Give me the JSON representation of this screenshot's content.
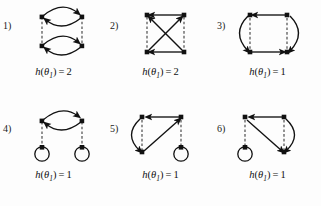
{
  "figure": {
    "name": "directed-graph-motif-figure",
    "background": "#fdfdfd",
    "ink_color": "#111111",
    "dashed_color": "#4d4d4d",
    "panels": [
      {
        "index_label": "1)",
        "caption": {
          "function": "h",
          "open": "(",
          "symbol": "θ",
          "subscript": "1",
          "close": ")",
          "equals": "=",
          "value": "2",
          "full": "h(θ₁) = 2"
        },
        "structure": "two stacked two-node bidirectional lens cycles joined by two vertical dashed links",
        "nodes": 4,
        "self_loops": 0,
        "dashed_links": 2,
        "directed_arcs": 4
      },
      {
        "index_label": "2)",
        "caption": {
          "function": "h",
          "open": "(",
          "symbol": "θ",
          "subscript": "1",
          "close": ")",
          "equals": "=",
          "value": "2",
          "full": "h(θ₁) = 2"
        },
        "structure": "square of four nodes with leftward top and bottom arrows, two crossing diagonal arrows, vertical dashed sides",
        "nodes": 4,
        "self_loops": 0,
        "dashed_links": 2,
        "directed_arcs": 4
      },
      {
        "index_label": "3)",
        "caption": {
          "function": "h",
          "open": "(",
          "symbol": "θ",
          "subscript": "1",
          "close": ")",
          "equals": "=",
          "value": "1",
          "full": "h(θ₁) = 1"
        },
        "structure": "rectangle of four nodes, leftward top arrow, rightward bottom arrow, outward curved arcs on left and right sides, vertical dashed links",
        "nodes": 4,
        "self_loops": 0,
        "dashed_links": 2,
        "directed_arcs": 4
      },
      {
        "index_label": "4)",
        "caption": {
          "function": "h",
          "open": "(",
          "symbol": "θ",
          "subscript": "1",
          "close": ")",
          "equals": "=",
          "value": "1",
          "full": "h(θ₁) = 1"
        },
        "structure": "top two-node bidirectional lens cycle with two vertical dashed links down to two nodes each carrying a self-loop",
        "nodes": 4,
        "self_loops": 2,
        "dashed_links": 2,
        "directed_arcs": 2
      },
      {
        "index_label": "5)",
        "caption": {
          "function": "h",
          "open": "(",
          "symbol": "θ",
          "subscript": "1",
          "close": ")",
          "equals": "=",
          "value": "1",
          "full": "h(θ₁) = 1"
        },
        "structure": "triangle cycle: leftward top arrow, left outward curved arc downward, diagonal arrow up to top-right, plus dashed links and one self-loop on the lower-right node",
        "nodes": 4,
        "self_loops": 1,
        "dashed_links": 2,
        "directed_arcs": 3
      },
      {
        "index_label": "6)",
        "caption": {
          "function": "h",
          "open": "(",
          "symbol": "θ",
          "subscript": "1",
          "close": ")",
          "equals": "=",
          "value": "1",
          "full": "h(θ₁) = 1"
        },
        "structure": "mirrored triangle cycle: leftward top arrow, right outward curved arc downward, diagonal arrow up to top-left, plus dashed links and one self-loop on the lower-left node",
        "nodes": 4,
        "self_loops": 1,
        "dashed_links": 2,
        "directed_arcs": 3
      }
    ]
  }
}
